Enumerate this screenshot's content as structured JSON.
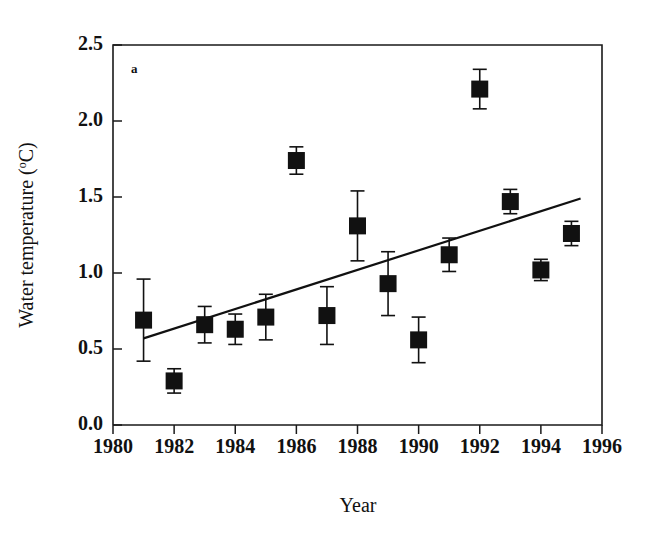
{
  "figure": {
    "panel_label": "a",
    "background_color": "#ffffff",
    "ink_color": "#111111"
  },
  "chart_data": {
    "type": "scatter",
    "title": "",
    "xlabel": "Year",
    "ylabel": "Water temperature (oC)",
    "ylabel_main": "Water temperature (",
    "ylabel_superscript": "o",
    "ylabel_tail": "C)",
    "xlim": [
      1980,
      1996
    ],
    "ylim": [
      0.0,
      2.5
    ],
    "xticks": [
      1980,
      1982,
      1984,
      1986,
      1988,
      1990,
      1992,
      1994,
      1996
    ],
    "xticklabels": [
      "1980",
      "1982",
      "1984",
      "1986",
      "1988",
      "1990",
      "1992",
      "1994",
      "1996"
    ],
    "yticks": [
      0.0,
      0.5,
      1.0,
      1.5,
      2.0,
      2.5
    ],
    "yticklabels": [
      "0.0",
      "0.5",
      "1.0",
      "1.5",
      "2.0",
      "2.5"
    ],
    "grid": false,
    "legend": null,
    "marker_style": "filled-square",
    "error_bar_style": "capped",
    "x": [
      1981,
      1982,
      1983,
      1984,
      1985,
      1986,
      1987,
      1988,
      1989,
      1990,
      1991,
      1992,
      1993,
      1994,
      1995
    ],
    "values": [
      0.69,
      0.29,
      0.66,
      0.63,
      0.71,
      1.74,
      0.72,
      1.31,
      0.93,
      0.56,
      1.12,
      2.21,
      1.47,
      1.02,
      1.26
    ],
    "errors": [
      0.27,
      0.08,
      0.12,
      0.1,
      0.15,
      0.09,
      0.19,
      0.23,
      0.21,
      0.15,
      0.11,
      0.13,
      0.08,
      0.07,
      0.08
    ],
    "series": [
      {
        "name": "Water temperature",
        "points": [
          {
            "x": 1981,
            "y": 0.69,
            "err": 0.27
          },
          {
            "x": 1982,
            "y": 0.29,
            "err": 0.08
          },
          {
            "x": 1983,
            "y": 0.66,
            "err": 0.12
          },
          {
            "x": 1984,
            "y": 0.63,
            "err": 0.1
          },
          {
            "x": 1985,
            "y": 0.71,
            "err": 0.15
          },
          {
            "x": 1986,
            "y": 1.74,
            "err": 0.09
          },
          {
            "x": 1987,
            "y": 0.72,
            "err": 0.19
          },
          {
            "x": 1988,
            "y": 1.31,
            "err": 0.23
          },
          {
            "x": 1989,
            "y": 0.93,
            "err": 0.21
          },
          {
            "x": 1990,
            "y": 0.56,
            "err": 0.15
          },
          {
            "x": 1991,
            "y": 1.12,
            "err": 0.11
          },
          {
            "x": 1992,
            "y": 2.21,
            "err": 0.13
          },
          {
            "x": 1993,
            "y": 1.47,
            "err": 0.08
          },
          {
            "x": 1994,
            "y": 1.02,
            "err": 0.07
          },
          {
            "x": 1995,
            "y": 1.26,
            "err": 0.08
          }
        ]
      }
    ],
    "trendline": {
      "type": "linear-regression",
      "x_start": 1981.0,
      "y_start": 0.57,
      "x_end": 1995.3,
      "y_end": 1.49
    }
  }
}
